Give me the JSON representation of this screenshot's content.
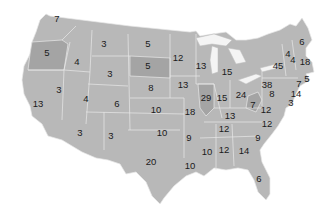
{
  "map": {
    "title": "",
    "colors": {
      "land": "#b8b8b8",
      "land_dark": "#a2a2a2",
      "border": "#e8e8e8",
      "water": "#f4f4f4",
      "label": "#1a1a1a"
    },
    "states": [
      {
        "abbr": "WA",
        "value": "7",
        "x": 57,
        "y": 19
      },
      {
        "abbr": "OR",
        "value": "5",
        "x": 47,
        "y": 53
      },
      {
        "abbr": "CA",
        "value": "13",
        "x": 38,
        "y": 104
      },
      {
        "abbr": "ID",
        "value": "4",
        "x": 77,
        "y": 62
      },
      {
        "abbr": "NV",
        "value": "3",
        "x": 59,
        "y": 90
      },
      {
        "abbr": "MT",
        "value": "3",
        "x": 104,
        "y": 44
      },
      {
        "abbr": "WY",
        "value": "3",
        "x": 110,
        "y": 74
      },
      {
        "abbr": "UT",
        "value": "4",
        "x": 86,
        "y": 99
      },
      {
        "abbr": "CO",
        "value": "6",
        "x": 117,
        "y": 104
      },
      {
        "abbr": "AZ",
        "value": "3",
        "x": 80,
        "y": 133
      },
      {
        "abbr": "NM",
        "value": "3",
        "x": 111,
        "y": 136
      },
      {
        "abbr": "ND",
        "value": "5",
        "x": 148,
        "y": 44
      },
      {
        "abbr": "SD",
        "value": "5",
        "x": 148,
        "y": 66
      },
      {
        "abbr": "NE",
        "value": "8",
        "x": 151,
        "y": 88
      },
      {
        "abbr": "KS",
        "value": "10",
        "x": 156,
        "y": 110
      },
      {
        "abbr": "OK",
        "value": "10",
        "x": 162,
        "y": 133
      },
      {
        "abbr": "TX",
        "value": "20",
        "x": 151,
        "y": 162
      },
      {
        "abbr": "MN",
        "value": "12",
        "x": 178,
        "y": 58
      },
      {
        "abbr": "IA",
        "value": "13",
        "x": 183,
        "y": 85
      },
      {
        "abbr": "MO",
        "value": "18",
        "x": 190,
        "y": 112
      },
      {
        "abbr": "AR",
        "value": "9",
        "x": 189,
        "y": 138
      },
      {
        "abbr": "LA",
        "value": "10",
        "x": 190,
        "y": 166
      },
      {
        "abbr": "WI",
        "value": "13",
        "x": 201,
        "y": 66
      },
      {
        "abbr": "IL",
        "value": "29",
        "x": 206,
        "y": 98
      },
      {
        "abbr": "MI",
        "value": "15",
        "x": 227,
        "y": 72
      },
      {
        "abbr": "IN",
        "value": "15",
        "x": 222,
        "y": 98
      },
      {
        "abbr": "OH",
        "value": "24",
        "x": 241,
        "y": 95
      },
      {
        "abbr": "KY",
        "value": "13",
        "x": 230,
        "y": 116
      },
      {
        "abbr": "TN",
        "value": "12",
        "x": 224,
        "y": 129
      },
      {
        "abbr": "MS",
        "value": "10",
        "x": 207,
        "y": 152
      },
      {
        "abbr": "AL",
        "value": "12",
        "x": 224,
        "y": 150
      },
      {
        "abbr": "GA",
        "value": "14",
        "x": 244,
        "y": 151
      },
      {
        "abbr": "FL",
        "value": "6",
        "x": 259,
        "y": 179
      },
      {
        "abbr": "SC",
        "value": "9",
        "x": 258,
        "y": 138
      },
      {
        "abbr": "NC",
        "value": "12",
        "x": 267,
        "y": 124
      },
      {
        "abbr": "VA",
        "value": "12",
        "x": 266,
        "y": 110
      },
      {
        "abbr": "WV",
        "value": "7",
        "x": 253,
        "y": 105
      },
      {
        "abbr": "PA",
        "value": "38",
        "x": 267,
        "y": 85
      },
      {
        "abbr": "NY",
        "value": "45",
        "x": 278,
        "y": 66
      },
      {
        "abbr": "MD",
        "value": "8",
        "x": 272,
        "y": 94
      },
      {
        "abbr": "DE",
        "value": "3",
        "x": 291,
        "y": 103
      },
      {
        "abbr": "NJ",
        "value": "14",
        "x": 296,
        "y": 94
      },
      {
        "abbr": "CT",
        "value": "7",
        "x": 299,
        "y": 84
      },
      {
        "abbr": "RI",
        "value": "5",
        "x": 307,
        "y": 79
      },
      {
        "abbr": "MA",
        "value": "18",
        "x": 305,
        "y": 62
      },
      {
        "abbr": "VT",
        "value": "4",
        "x": 288,
        "y": 54
      },
      {
        "abbr": "NH",
        "value": "4",
        "x": 293,
        "y": 60
      },
      {
        "abbr": "ME",
        "value": "6",
        "x": 302,
        "y": 42
      }
    ]
  }
}
